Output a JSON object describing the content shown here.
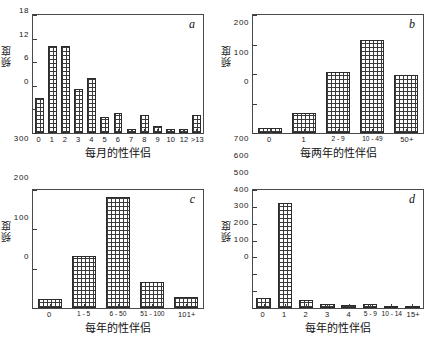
{
  "figure": {
    "background": "#ffffff",
    "bar_edge_color": "#2b2b2b",
    "axis_color": "#4a4a4a",
    "text_color": "#161616"
  },
  "chart_data": [
    {
      "type": "bar",
      "panel": "a",
      "title": "",
      "xlabel": "每月的性伴侣",
      "ylabel": "频度",
      "categories": [
        "0",
        "1",
        "2",
        "3",
        "4",
        "5",
        "6",
        "7",
        "8",
        "9",
        "10",
        "12",
        ">13"
      ],
      "values": [
        9,
        22,
        22,
        11.3,
        14,
        4,
        5,
        1,
        4.5,
        1.7,
        1,
        1,
        4.5
      ],
      "yticks": [
        0,
        6,
        12,
        18,
        24,
        30
      ],
      "ylim": [
        0,
        30
      ],
      "grid": false,
      "legend": "none"
    },
    {
      "type": "bar",
      "panel": "b",
      "title": "",
      "xlabel": "每两年的性伴侣",
      "ylabel": "频度",
      "categories": [
        "0",
        "1",
        "2 - 9",
        "10 - 49",
        "50+"
      ],
      "values": [
        18,
        68,
        208,
        315,
        198
      ],
      "yticks": [
        0,
        100,
        200,
        300,
        400
      ],
      "ylim": [
        0,
        400
      ],
      "grid": false,
      "legend": "none"
    },
    {
      "type": "bar",
      "panel": "c",
      "title": "",
      "xlabel": "每年的性伴侣",
      "ylabel": "频度",
      "categories": [
        "0",
        "1 - 5",
        "6 - 50",
        "51 - 100",
        "101+"
      ],
      "values": [
        22,
        133,
        281,
        66,
        27
      ],
      "yticks": [
        0,
        100,
        200,
        300
      ],
      "ylim": [
        0,
        300
      ],
      "grid": false,
      "legend": "none"
    },
    {
      "type": "bar",
      "panel": "d",
      "title": "",
      "xlabel": "每年的性伴侣",
      "ylabel": "频度",
      "categories": [
        "0",
        "1",
        "2",
        "3",
        "4",
        "5 - 9",
        "10 - 14",
        "15+"
      ],
      "values": [
        60,
        625,
        48,
        25,
        20,
        22,
        8,
        5
      ],
      "yticks": [
        0,
        100,
        200,
        300,
        400,
        500,
        600,
        700
      ],
      "ylim": [
        0,
        700
      ],
      "grid": false,
      "legend": "none"
    }
  ],
  "panels": {
    "a": {
      "letter": "a",
      "xtitle": "每月的性伴侣",
      "ytitle": "频度",
      "yticks": [
        "0",
        "6",
        "12",
        "18",
        "24",
        "30"
      ],
      "xticks": [
        "0",
        "1",
        "2",
        "3",
        "4",
        "5",
        "6",
        "7",
        "8",
        "9",
        "10",
        "12",
        ">13"
      ]
    },
    "b": {
      "letter": "b",
      "xtitle": "每两年的性伴侣",
      "ytitle": "频度",
      "yticks": [
        "0",
        "100",
        "200",
        "300",
        "400"
      ],
      "xticks": [
        "0",
        "1",
        "2 - 9",
        "10 - 49",
        "50+"
      ]
    },
    "c": {
      "letter": "c",
      "xtitle": "每年的性伴侣",
      "ytitle": "频度",
      "yticks": [
        "0",
        "100",
        "200",
        "300"
      ],
      "xticks": [
        "0",
        "1 - 5",
        "6 - 50",
        "51 - 100",
        "101+"
      ]
    },
    "d": {
      "letter": "d",
      "xtitle": "每年的性伴侣",
      "ytitle": "频度",
      "yticks": [
        "0",
        "100",
        "200",
        "300",
        "400",
        "500",
        "600",
        "700"
      ],
      "xticks": [
        "0",
        "1",
        "2",
        "3",
        "4",
        "5 - 9",
        "10 - 14",
        "15+"
      ]
    }
  }
}
